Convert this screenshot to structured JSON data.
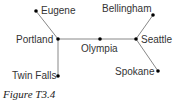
{
  "figure": {
    "caption": "Figure T3.4",
    "nodes": [
      {
        "id": "eugene",
        "label": "Eugene"
      },
      {
        "id": "portland",
        "label": "Portland"
      },
      {
        "id": "olympia",
        "label": "Olympia"
      },
      {
        "id": "seattle",
        "label": "Seattle"
      },
      {
        "id": "bellingham",
        "label": "Bellingham"
      },
      {
        "id": "spokane",
        "label": "Spokane"
      },
      {
        "id": "twin_falls",
        "label": "Twin Falls"
      }
    ],
    "edges": [
      [
        "Eugene",
        "Portland"
      ],
      [
        "Portland",
        "Olympia"
      ],
      [
        "Olympia",
        "Seattle"
      ],
      [
        "Seattle",
        "Bellingham"
      ],
      [
        "Seattle",
        "Spokane"
      ],
      [
        "Portland",
        "Twin Falls"
      ]
    ],
    "colors": {
      "line": "#888888",
      "dot": "#000000",
      "text": "#333333"
    }
  }
}
